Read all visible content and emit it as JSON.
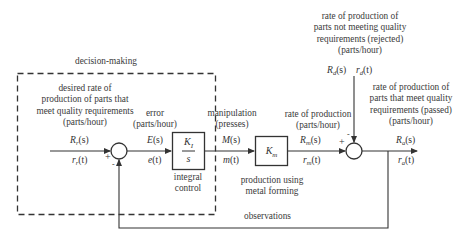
{
  "title_box_label": "decision-making",
  "nodes": {
    "reference": {
      "description": [
        "desired rate of",
        "production of parts that",
        "meet quality requirements",
        "(parts/hour)"
      ],
      "laplace": {
        "base": "R",
        "sub": "r",
        "arg": "(s)"
      },
      "time": {
        "base": "r",
        "sub": "r",
        "arg": "(t)"
      }
    },
    "error": {
      "description": [
        "error",
        "(parts/hour)"
      ],
      "laplace": {
        "base": "E",
        "arg": "(s)"
      },
      "time": {
        "base": "e",
        "arg": "(t)"
      }
    },
    "manipulation": {
      "description": [
        "manipulation",
        "(presses)"
      ],
      "laplace": {
        "base": "M",
        "arg": "(s)"
      },
      "time": {
        "base": "m",
        "arg": "(t)"
      }
    },
    "production": {
      "description": [
        "rate of production",
        "(parts/hour)"
      ],
      "laplace": {
        "base": "R",
        "sub": "m",
        "arg": "(s)"
      },
      "time": {
        "base": "r",
        "sub": "m",
        "arg": "(t)"
      }
    },
    "rejected": {
      "description": [
        "rate of production of",
        "parts not meeting quality",
        "requirements (rejected)",
        "(parts/hour)"
      ],
      "laplace": {
        "base": "R",
        "sub": "d",
        "arg": "(s)"
      },
      "time": {
        "base": "r",
        "sub": "d",
        "arg": "(t)"
      }
    },
    "passed": {
      "description": [
        "rate of production of",
        "parts that meet quality",
        "requirements (passed)",
        "(parts/hour)"
      ],
      "laplace": {
        "base": "R",
        "sub": "a",
        "arg": "(s)"
      },
      "time": {
        "base": "r",
        "sub": "a",
        "arg": "(t)"
      }
    }
  },
  "blocks": {
    "controller": {
      "numerator": {
        "base": "K",
        "sub": "I"
      },
      "denominator": "s",
      "caption": [
        "integral",
        "control"
      ]
    },
    "process": {
      "gain": {
        "base": "K",
        "sub": "m"
      },
      "caption": [
        "production using",
        "metal forming"
      ]
    }
  },
  "junctions": {
    "error_sum": {
      "plus": "+",
      "minus": "-"
    },
    "output_sum": {
      "plus": "+",
      "minus": "-"
    }
  },
  "feedback_label": "observations"
}
